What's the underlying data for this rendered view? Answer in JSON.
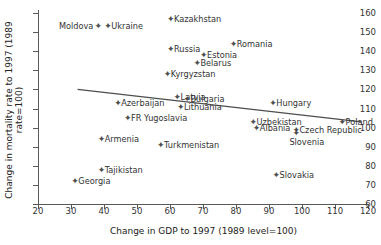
{
  "chart_data": {
    "type": "scatter",
    "title": "",
    "xlabel": "Change in GDP to 1997 (1989 level=100)",
    "ylabel": "Change in mortality rate to 1997 (1989 rate=100)",
    "xlim": [
      20,
      120
    ],
    "ylim": [
      60,
      160
    ],
    "xticks": [
      20,
      30,
      40,
      50,
      60,
      70,
      80,
      90,
      100,
      110,
      120
    ],
    "yticks": [
      60,
      70,
      80,
      90,
      100,
      110,
      120,
      130,
      140,
      150,
      160
    ],
    "grid": false,
    "legend": null,
    "marker_color": "#4d4d4d",
    "trendline_color": "#4d4d4d",
    "points": [
      {
        "label": "Moldova",
        "x": 38,
        "y": 153,
        "label_pos": "left"
      },
      {
        "label": "Ukraine",
        "x": 41,
        "y": 153,
        "label_pos": "right"
      },
      {
        "label": "Kazakhstan",
        "x": 60,
        "y": 157,
        "label_pos": "right"
      },
      {
        "label": "Russia",
        "x": 60,
        "y": 141,
        "label_pos": "right"
      },
      {
        "label": "Romania",
        "x": 79,
        "y": 144,
        "label_pos": "right"
      },
      {
        "label": "Estonia",
        "x": 70,
        "y": 138,
        "label_pos": "right"
      },
      {
        "label": "Belarus",
        "x": 68,
        "y": 134,
        "label_pos": "right"
      },
      {
        "label": "Kyrgyzstan",
        "x": 59,
        "y": 128,
        "label_pos": "right"
      },
      {
        "label": "Latvia",
        "x": 62,
        "y": 116,
        "label_pos": "right"
      },
      {
        "label": "Bulgaria",
        "x": 65,
        "y": 115,
        "label_pos": "right"
      },
      {
        "label": "Azerbaijan",
        "x": 44,
        "y": 113,
        "label_pos": "right"
      },
      {
        "label": "Lithuania",
        "x": 63,
        "y": 111,
        "label_pos": "right"
      },
      {
        "label": "Hungary",
        "x": 91,
        "y": 113,
        "label_pos": "right"
      },
      {
        "label": "FR Yugoslavia",
        "x": 47,
        "y": 105,
        "label_pos": "right"
      },
      {
        "label": "Uzbekistan",
        "x": 85,
        "y": 103,
        "label_pos": "right"
      },
      {
        "label": "Poland",
        "x": 112,
        "y": 103,
        "label_pos": "right"
      },
      {
        "label": "Albania",
        "x": 86,
        "y": 100,
        "label_pos": "right"
      },
      {
        "label": "Czech Republic",
        "x": 98,
        "y": 99,
        "label_pos": "right"
      },
      {
        "label": "Slovenia",
        "x": 98,
        "y": 97,
        "label_pos": "below"
      },
      {
        "label": "Armenia",
        "x": 39,
        "y": 94,
        "label_pos": "right"
      },
      {
        "label": "Turkmenistan",
        "x": 57,
        "y": 91,
        "label_pos": "right"
      },
      {
        "label": "Tajikistan",
        "x": 39,
        "y": 78,
        "label_pos": "right"
      },
      {
        "label": "Georgia",
        "x": 31,
        "y": 72,
        "label_pos": "right"
      },
      {
        "label": "Slovakia",
        "x": 92,
        "y": 75,
        "label_pos": "right"
      }
    ],
    "trendline": {
      "x0": 32,
      "y0": 120,
      "x1": 118,
      "y1": 103
    }
  }
}
